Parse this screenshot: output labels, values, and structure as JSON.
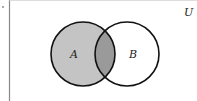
{
  "diagram": {
    "type": "venn",
    "universe_label": "U",
    "sets": [
      {
        "label": "A",
        "shaded": true
      },
      {
        "label": "B",
        "shaded": false
      }
    ],
    "intersection_shaded": true,
    "colors": {
      "set_a_fill": "#c4c4c4",
      "intersection_fill": "#9a9a9a",
      "set_b_fill": "#ffffff",
      "stroke": "#111111",
      "border": "#888888"
    }
  }
}
